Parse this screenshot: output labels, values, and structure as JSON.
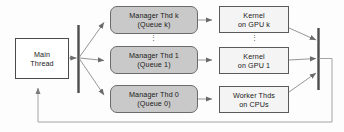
{
  "diagram": {
    "background_color": "#fdfdfd",
    "colors": {
      "manager_fill": "#c9c9c9",
      "main_fill": "#ffffff",
      "worker_fill": "#f4f4f4",
      "stroke": "#555555",
      "bar": "#4d4d4d",
      "text": "#1a1a1a"
    },
    "nodes": {
      "main_thread": {
        "line1": "Main",
        "line2": "Thread"
      },
      "manager_k": {
        "line1": "Manager Thd k",
        "line2": "(Queue k)"
      },
      "manager_1": {
        "line1": "Manager Thd 1",
        "line2": "(Queue 1)"
      },
      "manager_0": {
        "line1": "Manager Thd 0",
        "line2": "(Queue 0)"
      },
      "kernel_k": {
        "line1": "Kernel",
        "line2": "on GPU k"
      },
      "kernel_1": {
        "line1": "Kernel",
        "line2": "on GPU 1"
      },
      "worker_cpus": {
        "line1": "Worker Thds",
        "line2": "on CPUs"
      }
    },
    "ellipsis": {
      "managers": "⋮",
      "kernels": "⋮"
    },
    "bars": {
      "fork_label": "fork-bar",
      "join_label": "join-bar"
    }
  }
}
